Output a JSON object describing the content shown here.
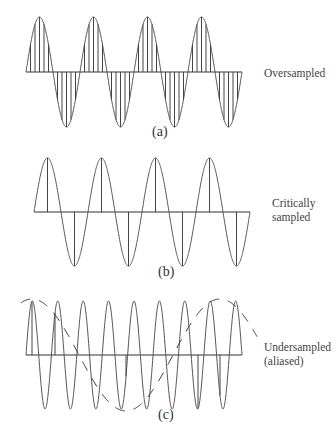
{
  "figure": {
    "stroke_color": "#555555",
    "panels": [
      {
        "id": "a",
        "caption": "(a)",
        "label_lines": [
          "Oversampled"
        ],
        "baseline_y": 72,
        "x0": 26,
        "x1": 242,
        "amplitude": 55,
        "cycles": 4,
        "phase_start": "zero",
        "samples_per_cycle": 12,
        "alias": false,
        "caption_pos": [
          152,
          132
        ],
        "label_pos": [
          264,
          66
        ]
      },
      {
        "id": "b",
        "caption": "(b)",
        "label_lines": [
          "Critically",
          "sampled"
        ],
        "baseline_y": 212,
        "x0": 34,
        "x1": 250,
        "amplitude": 54,
        "cycles": 4,
        "phase_start": "zero",
        "samples_per_cycle": 2,
        "alias": false,
        "caption_pos": [
          158,
          272
        ],
        "label_pos": [
          272,
          201
        ]
      },
      {
        "id": "c",
        "caption": "(c)",
        "label_lines": [
          "Undersampled",
          "(aliased)"
        ],
        "baseline_y": 355,
        "x0": 26,
        "x1": 242,
        "amplitude": 54,
        "cycles": 8.5,
        "phase_start": "zero",
        "sample_x": [
          32,
          55,
          126,
          198,
          220
        ],
        "alias": true,
        "caption_pos": [
          158,
          414
        ],
        "label_pos": [
          264,
          345
        ]
      }
    ]
  }
}
